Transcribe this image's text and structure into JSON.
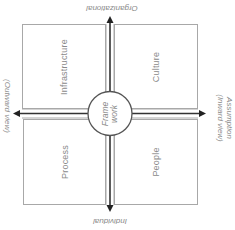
{
  "diagram": {
    "center": {
      "line1": "Frame",
      "line2": "work"
    },
    "quadrants": [
      {
        "id": "top-left",
        "label": "Infrastructure"
      },
      {
        "id": "top-right",
        "label": "Culture"
      },
      {
        "id": "bottom-left",
        "label": "Process"
      },
      {
        "id": "bottom-right",
        "label": "People"
      }
    ],
    "axes": {
      "top": "Organizational",
      "bottom": "Individual",
      "left": "(Outward view)",
      "right_line1": "Assumption",
      "right_line2": "(Inward view)"
    },
    "colors": {
      "line": "#a8a8a8",
      "arrow": "#333333",
      "text": "#8a8a8a"
    }
  }
}
